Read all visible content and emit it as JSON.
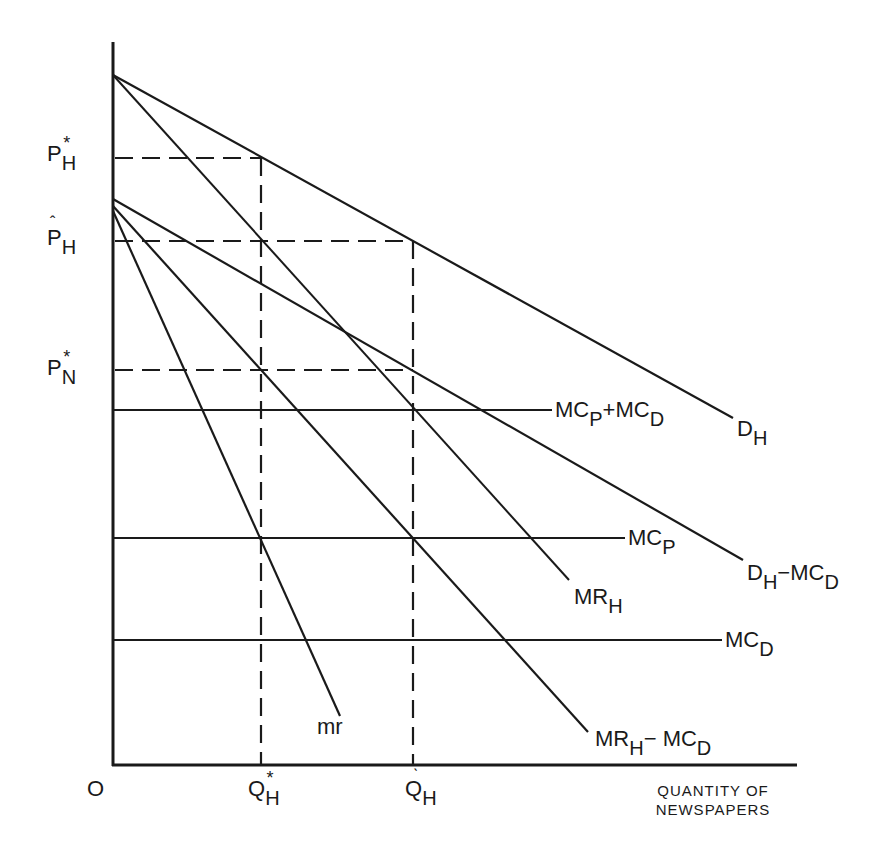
{
  "diagram": {
    "type": "economics-price-quantity-diagram",
    "axes": {
      "origin_label": "O",
      "x_axis_label_line1": "QUANTITY OF",
      "x_axis_label_line2": "NEWSPAPERS",
      "y_axis_label": ""
    },
    "price_labels": [
      {
        "base": "P",
        "sub": "H",
        "mark": "*",
        "name": "P*_H"
      },
      {
        "base": "P",
        "sub": "H",
        "mark": "^",
        "name": "P̂_H"
      },
      {
        "base": "P",
        "sub": "N",
        "mark": "*",
        "name": "P*_N"
      }
    ],
    "quantity_labels": [
      {
        "base": "Q",
        "sub": "H",
        "mark": "*",
        "name": "Q*_H"
      },
      {
        "base": "Q",
        "sub": "H",
        "mark": "^",
        "name": "Q̂_H"
      }
    ],
    "curves": [
      {
        "id": "D_H",
        "base": "D",
        "sub": "H",
        "rest": "",
        "kind": "demand"
      },
      {
        "id": "MR_H",
        "base": "MR",
        "sub": "H",
        "rest": "",
        "kind": "marginal-revenue"
      },
      {
        "id": "D_H-MC_D",
        "base": "D",
        "sub": "H",
        "rest": "−MC",
        "rest_sub": "D",
        "kind": "net-demand"
      },
      {
        "id": "MR_H-MC_D",
        "base": "MR",
        "sub": "H",
        "rest": "−  MC",
        "rest_sub": "D",
        "kind": "net-marginal-revenue"
      },
      {
        "id": "mr",
        "base": "mr",
        "sub": "",
        "rest": "",
        "kind": "marginal-revenue"
      },
      {
        "id": "MC_P+MC_D",
        "base": "MC",
        "sub": "P",
        "rest": "+MC",
        "rest_sub": "D",
        "kind": "marginal-cost"
      },
      {
        "id": "MC_P",
        "base": "MC",
        "sub": "P",
        "rest": "",
        "kind": "marginal-cost"
      },
      {
        "id": "MC_D",
        "base": "MC",
        "sub": "D",
        "rest": "",
        "kind": "marginal-cost"
      }
    ],
    "colors": {
      "ink": "#1a1a1a",
      "background": "#ffffff"
    }
  }
}
